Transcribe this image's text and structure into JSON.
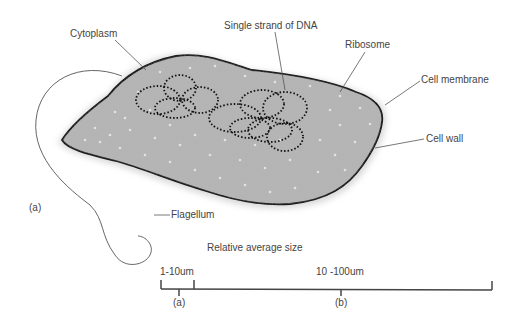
{
  "diagram": {
    "panel_label": "(a)",
    "labels": {
      "cytoplasm": "Cytoplasm",
      "dna": "Single strand of DNA",
      "ribosome": "Ribosome",
      "cell_membrane": "Cell membrane",
      "cell_wall": "Cell wall",
      "flagellum": "Flagellum"
    },
    "scale": {
      "title": "Relative average size",
      "range_a": "1-10um",
      "range_b": "10 -100um",
      "marker_a": "(a)",
      "marker_b": "(b)"
    },
    "colors": {
      "cytoplasm_fill": "#b5b5b5",
      "outline": "#1a1a1a",
      "label_text": "#444444"
    }
  }
}
